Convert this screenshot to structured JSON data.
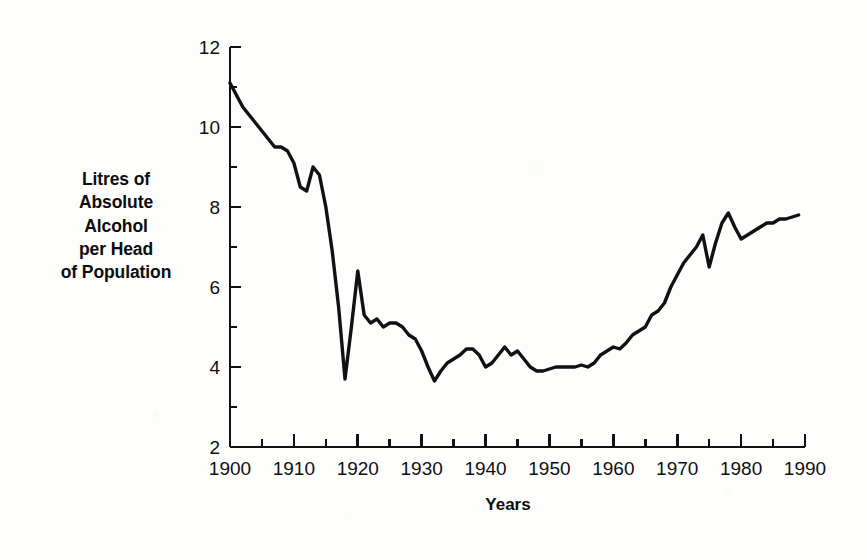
{
  "chart_data": {
    "type": "line",
    "title": "",
    "xlabel": "Years",
    "ylabel": "Litres of Absolute Alcohol per Head of Population",
    "ylabel_lines": [
      "Litres of",
      "Absolute",
      "Alcohol",
      "per Head",
      "of Population"
    ],
    "xlim": [
      1900,
      1990
    ],
    "ylim": [
      2,
      12
    ],
    "xticks": [
      1900,
      1910,
      1920,
      1930,
      1940,
      1950,
      1960,
      1970,
      1980,
      1990
    ],
    "xtick_labels": [
      "1900",
      "1910",
      "1920",
      "1930",
      "1940",
      "1950",
      "1960",
      "1970",
      "1980",
      "1990"
    ],
    "x_minor_tick_interval": 5,
    "yticks": [
      2,
      4,
      6,
      8,
      10,
      12
    ],
    "ytick_labels": [
      "2",
      "4",
      "6",
      "8",
      "10",
      "12"
    ],
    "y_minor_ticks": [
      3,
      5,
      7,
      9,
      11
    ],
    "grid": false,
    "legend": null,
    "line_color": "#111111",
    "line_width": 3.4,
    "series": [
      {
        "name": "Litres of absolute alcohol per head of population",
        "x": [
          1900,
          1901,
          1902,
          1903,
          1904,
          1905,
          1906,
          1907,
          1908,
          1909,
          1910,
          1911,
          1912,
          1913,
          1914,
          1915,
          1916,
          1917,
          1918,
          1919,
          1920,
          1921,
          1922,
          1923,
          1924,
          1925,
          1926,
          1927,
          1928,
          1929,
          1930,
          1931,
          1932,
          1933,
          1934,
          1935,
          1936,
          1937,
          1938,
          1939,
          1940,
          1941,
          1942,
          1943,
          1944,
          1945,
          1946,
          1947,
          1948,
          1949,
          1950,
          1951,
          1952,
          1953,
          1954,
          1955,
          1956,
          1957,
          1958,
          1959,
          1960,
          1961,
          1962,
          1963,
          1964,
          1965,
          1966,
          1967,
          1968,
          1969,
          1970,
          1971,
          1972,
          1973,
          1974,
          1975,
          1976,
          1977,
          1978,
          1979,
          1980,
          1981,
          1982,
          1983,
          1984,
          1985,
          1986,
          1987,
          1988,
          1989
        ],
        "y": [
          11.1,
          10.8,
          10.5,
          10.3,
          10.1,
          9.9,
          9.7,
          9.5,
          9.5,
          9.4,
          9.1,
          8.5,
          8.4,
          9.0,
          8.8,
          8.0,
          6.9,
          5.5,
          3.7,
          5.0,
          6.4,
          5.3,
          5.1,
          5.2,
          5.0,
          5.1,
          5.1,
          5.0,
          4.8,
          4.7,
          4.4,
          4.0,
          3.65,
          3.9,
          4.1,
          4.2,
          4.3,
          4.45,
          4.45,
          4.3,
          4.0,
          4.1,
          4.3,
          4.5,
          4.3,
          4.4,
          4.2,
          4.0,
          3.9,
          3.9,
          3.95,
          4.0,
          4.0,
          4.0,
          4.0,
          4.05,
          4.0,
          4.1,
          4.3,
          4.4,
          4.5,
          4.45,
          4.6,
          4.8,
          4.9,
          5.0,
          5.3,
          5.4,
          5.6,
          6.0,
          6.3,
          6.6,
          6.8,
          7.0,
          7.3,
          6.5,
          7.1,
          7.6,
          7.85,
          7.5,
          7.2,
          7.3,
          7.4,
          7.5,
          7.6,
          7.6,
          7.7,
          7.7,
          7.75,
          7.8
        ]
      }
    ]
  },
  "axis": {
    "x_title": "Years"
  }
}
